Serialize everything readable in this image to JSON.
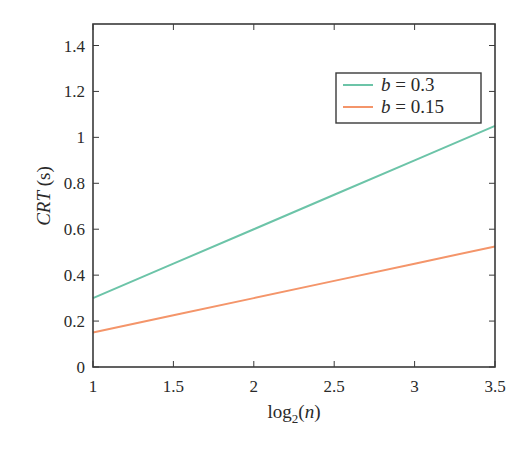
{
  "chart_data": {
    "type": "line",
    "title": "",
    "xlabel": "log2(n)",
    "ylabel": "CRT (s)",
    "xlim": [
      1,
      3.5
    ],
    "ylim": [
      0,
      1.5
    ],
    "x_ticks": [
      1,
      1.5,
      2,
      2.5,
      3,
      3.5
    ],
    "x_tick_labels": [
      "1",
      "1.5",
      "2",
      "2.5",
      "3",
      "3.5"
    ],
    "y_ticks": [
      0,
      0.2,
      0.4,
      0.6,
      0.8,
      1,
      1.2,
      1.4
    ],
    "y_tick_labels": [
      "0",
      "0.2",
      "0.4",
      "0.6",
      "0.8",
      "1",
      "1.2",
      "1.4"
    ],
    "grid": false,
    "legend_position": "upper right",
    "x": [
      1,
      1.5,
      2,
      2.5,
      3,
      3.5
    ],
    "series": [
      {
        "name": "b = 0.3",
        "color": "#6cc4a8",
        "values": [
          0.3,
          0.45,
          0.6,
          0.75,
          0.9,
          1.05
        ]
      },
      {
        "name": "b = 0.15",
        "color": "#f4956a",
        "values": [
          0.15,
          0.225,
          0.3,
          0.375,
          0.45,
          0.525
        ]
      }
    ]
  },
  "labels": {
    "ylabel_main": "CRT",
    "ylabel_unit": " (s)",
    "xlabel_prefix": "log",
    "xlabel_sub": "2",
    "xlabel_paren_open": "(",
    "xlabel_var": "n",
    "xlabel_paren_close": ")"
  },
  "legend": [
    {
      "var": "b",
      "rest": " = 0.3",
      "color": "#6cc4a8"
    },
    {
      "var": "b",
      "rest": " = 0.15",
      "color": "#f4956a"
    }
  ]
}
